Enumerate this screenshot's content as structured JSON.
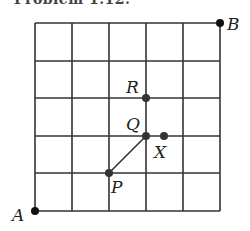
{
  "header": {
    "cut_text": "Problem 1.12."
  },
  "grid": {
    "rows": 5,
    "cols": 5,
    "origin_px": [
      35,
      211
    ],
    "cell_px": 37,
    "line_color": "#333333"
  },
  "points": [
    {
      "label": "A",
      "grid": [
        0,
        0
      ]
    },
    {
      "label": "B",
      "grid": [
        5,
        5
      ]
    },
    {
      "label": "P",
      "grid": [
        2,
        1
      ]
    },
    {
      "label": "Q",
      "grid": [
        3,
        2
      ]
    },
    {
      "label": "R",
      "grid": [
        3,
        3
      ]
    },
    {
      "label": "X",
      "grid": [
        3.5,
        2
      ]
    }
  ],
  "segments": [
    {
      "from": "P",
      "to": "Q"
    }
  ],
  "labels": {
    "A": "A",
    "B": "B",
    "P": "P",
    "Q": "Q",
    "R": "R",
    "X": "X"
  }
}
